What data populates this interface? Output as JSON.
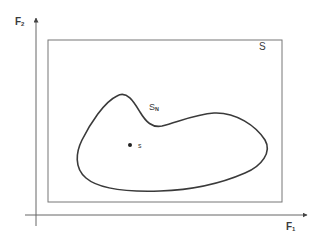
{
  "diagram": {
    "axes": {
      "y_label": {
        "main": "F",
        "sub": "2"
      },
      "x_label": {
        "main": "F",
        "sub": "1"
      }
    },
    "region_outer": {
      "label": "S"
    },
    "region_inner": {
      "label_main": "S",
      "label_sub": "N"
    },
    "point": {
      "label": "s"
    },
    "colors": {
      "line": "#555555",
      "curve": "#3a3a3a",
      "text": "#3a3a3a",
      "background": "#ffffff"
    }
  }
}
